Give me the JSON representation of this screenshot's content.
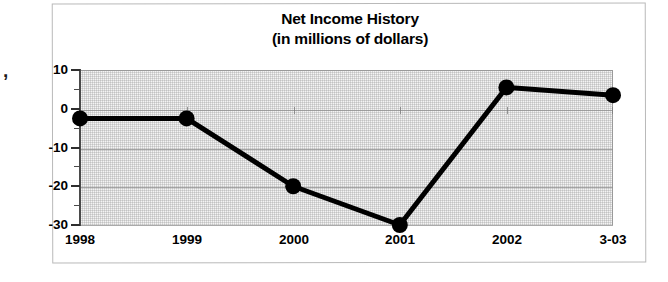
{
  "chart_data": {
    "type": "line",
    "title": "Net Income History",
    "subtitle": "(in millions of dollars)",
    "xlabel": "",
    "ylabel": "",
    "categories": [
      "1998",
      "1999",
      "2000",
      "2001",
      "2002",
      "3-03"
    ],
    "values": [
      -2.5,
      -2.5,
      -20,
      -30,
      5.5,
      3.5
    ],
    "series": [
      {
        "name": "Net Income",
        "values": [
          -2.5,
          -2.5,
          -20,
          -30,
          5.5,
          3.5
        ]
      }
    ],
    "ylim": [
      -30,
      10
    ],
    "ytick_labels": [
      "10",
      "0",
      "-10",
      "-20",
      "-30"
    ],
    "ytick_values": [
      10,
      0,
      -10,
      -20,
      -30
    ],
    "yminor_step": 5,
    "grid": true,
    "legend": false,
    "marker": "filled-circle",
    "line_color": "#000000",
    "marker_color": "#000000",
    "plot_background": "#f4f4f4"
  },
  "figure": {
    "edge_artifact": ",",
    "frame_border_color": "#b9b9b9",
    "rule_color": "#111111"
  }
}
